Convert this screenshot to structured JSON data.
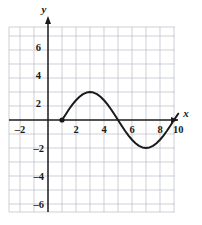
{
  "chart_data": {
    "type": "line",
    "title": "",
    "xlabel": "x",
    "ylabel": "y",
    "xlim": [
      -2.8,
      10.2
    ],
    "ylim": [
      -7.0,
      7.5
    ],
    "grid": true,
    "grid_step": 1,
    "legend": "none",
    "xticks": [
      -2,
      2,
      4,
      6,
      8,
      10
    ],
    "xtick_labels": [
      "–2",
      "2",
      "4",
      "6",
      "8",
      "10"
    ],
    "yticks": [
      6,
      4,
      2,
      -2,
      -4,
      -6
    ],
    "ytick_labels": [
      "6",
      "4",
      "2",
      "–2",
      "–4",
      "–6"
    ],
    "series": [
      {
        "name": "curve",
        "description": "sine-like wave, one full period",
        "x": [
          1.0,
          1.25,
          1.5,
          1.75,
          2.0,
          2.25,
          2.5,
          2.75,
          3.0,
          3.25,
          3.5,
          3.75,
          4.0,
          4.25,
          4.5,
          4.75,
          5.0,
          5.25,
          5.5,
          5.75,
          6.0,
          6.25,
          6.5,
          6.75,
          7.0,
          7.25,
          7.5,
          7.75,
          8.0,
          8.25,
          8.5,
          8.75,
          9.0,
          9.3
        ],
        "y": [
          0.0,
          0.38,
          0.77,
          1.11,
          1.41,
          1.66,
          1.85,
          1.96,
          2.0,
          1.96,
          1.85,
          1.66,
          1.41,
          1.11,
          0.77,
          0.39,
          0.0,
          -0.39,
          -0.77,
          -1.11,
          -1.41,
          -1.66,
          -1.85,
          -1.96,
          -2.0,
          -1.96,
          -1.85,
          -1.66,
          -1.41,
          -1.11,
          -0.77,
          -0.39,
          0.0,
          0.45
        ],
        "endpoints": [
          {
            "x": 1.0,
            "y": 0.0,
            "marker": "filled-dot"
          }
        ]
      }
    ],
    "colors": {
      "curve": "#1a1a1a",
      "axis": "#1a1a1a",
      "gridline": "#b9bcc4",
      "background": "#ffffff"
    }
  },
  "axes": {
    "x_axis_label": "x",
    "y_axis_label": "y"
  }
}
